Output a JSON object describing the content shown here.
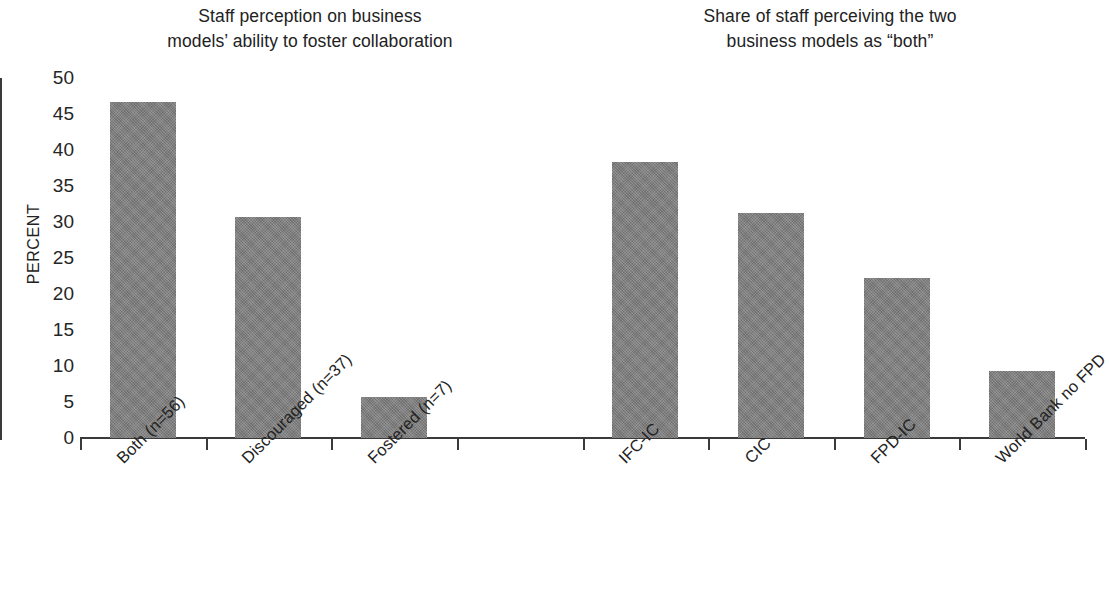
{
  "chart_data": {
    "type": "bar",
    "title": "",
    "panel_titles": [
      "Staff perception on business\nmodels’ ability to foster collaboration",
      "Share of staff perceiving the two\nbusiness models as “both”"
    ],
    "xlabel": "",
    "ylabel": "PERCENT",
    "ylim": [
      0,
      50
    ],
    "ytick_labels": [
      "50",
      "45",
      "40",
      "35",
      "30",
      "25",
      "20",
      "15",
      "10",
      "5",
      "0"
    ],
    "ytick_values": [
      50,
      45,
      40,
      35,
      30,
      25,
      20,
      15,
      10,
      5,
      0
    ],
    "grid": false,
    "legend": null,
    "bar_color": "#7d7d7d",
    "axis_color": "#3a3a3a",
    "categories": [
      "Both (n=56)",
      "Discouraged (n=37)",
      "Fostered (n=7)",
      "IFC-IC",
      "CIC",
      "FPD-IC",
      "World Bank no FPD"
    ],
    "values": [
      46.7,
      30.7,
      5.7,
      38.3,
      31.2,
      22.2,
      9.3
    ],
    "groups": [
      {
        "title": "Staff perception on business models’ ability to foster collaboration",
        "categories": [
          "Both (n=56)",
          "Discouraged (n=37)",
          "Fostered (n=7)"
        ],
        "values": [
          46.7,
          30.7,
          5.7
        ]
      },
      {
        "title": "Share of staff perceiving the two business models as “both”",
        "categories": [
          "IFC-IC",
          "CIC",
          "FPD-IC",
          "World Bank no FPD"
        ],
        "values": [
          38.3,
          31.2,
          22.2,
          9.3
        ]
      }
    ]
  }
}
